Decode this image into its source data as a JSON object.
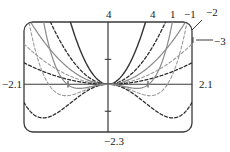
{
  "figure": {
    "name": "graphing-calculator-plot",
    "background": "#ffffff",
    "ink": "#3a3a3a",
    "frame": {
      "x": 24,
      "y": 22,
      "width": 168,
      "height": 110,
      "corner_radius": 9
    }
  },
  "axes": {
    "x_min": -2.1,
    "x_max": 2.1,
    "y_min": -2.3,
    "y_max": 3.0,
    "x_axis_y_value": 0,
    "y_axis_x_value": 0,
    "x_ticks": [
      -1,
      1
    ],
    "y_ticks": [
      -1.3,
      1.2
    ]
  },
  "labels": {
    "left": "−2.1",
    "right": "2.1",
    "bottom": "−2.3",
    "top_1": "4",
    "top_2": "4",
    "top_3": "1",
    "top_4": "−1",
    "top_5": "−2",
    "right_pointer": "−3"
  },
  "label_positions": {
    "left": {
      "x": 2,
      "y": 79
    },
    "right": {
      "x": 199,
      "y": 79
    },
    "bottom": {
      "x": 104,
      "y": 136
    },
    "top_1": {
      "x": 106,
      "y": 9
    },
    "top_2": {
      "x": 150,
      "y": 9
    },
    "top_3": {
      "x": 170,
      "y": 9
    },
    "top_4": {
      "x": 184,
      "y": 9
    },
    "top_5": {
      "x": 206,
      "y": 7
    },
    "right_pointer": {
      "x": 214,
      "y": 36
    }
  },
  "chart_data": {
    "type": "line",
    "title": "",
    "xlabel": "",
    "ylabel": "",
    "xlim": [
      -2.1,
      2.1
    ],
    "ylim": [
      -2.3,
      3.0
    ],
    "grid": false,
    "legend": false,
    "annotations": [
      {
        "text": "4",
        "anchor": "top",
        "note": "exponent label at top crossing"
      },
      {
        "text": "4",
        "anchor": "top",
        "note": "exponent label at top crossing"
      },
      {
        "text": "1",
        "anchor": "top",
        "note": "exponent label at top crossing"
      },
      {
        "text": "−1",
        "anchor": "top",
        "note": "exponent label at top crossing"
      },
      {
        "text": "−2",
        "anchor": "top-right",
        "note": "leader line to curve"
      },
      {
        "text": "−3",
        "anchor": "right",
        "note": "leader line to curve"
      },
      {
        "text": "−2.1",
        "anchor": "left",
        "note": "x window minimum"
      },
      {
        "text": "2.1",
        "anchor": "right",
        "note": "x window maximum"
      },
      {
        "text": "−2.3",
        "anchor": "bottom",
        "note": "y window minimum"
      }
    ],
    "series": [
      {
        "name": "solid-narrow-even",
        "style": "solid",
        "shade": "#333333",
        "width": 1.4,
        "kind": "even-power",
        "exponent": 2.0,
        "scale": 3.4
      },
      {
        "name": "dashed-even-wide",
        "style": "dashed",
        "shade": "#2e2e2e",
        "width": 1.3,
        "kind": "even-power",
        "exponent": 2.0,
        "scale": 1.45
      },
      {
        "name": "solid-gray-even",
        "style": "solid",
        "shade": "#8a8a8a",
        "width": 1.2,
        "kind": "even-power",
        "exponent": 2.0,
        "scale": 0.8
      },
      {
        "name": "dashed-gray-even",
        "style": "dashed",
        "shade": "#9a9a9a",
        "width": 1.1,
        "kind": "even-power",
        "exponent": 2.0,
        "scale": 0.44
      },
      {
        "name": "dashed-wide-outer",
        "style": "dashed",
        "shade": "#2e2e2e",
        "width": 1.3,
        "kind": "even-power",
        "exponent": 2.0,
        "scale": 0.235
      },
      {
        "name": "dashed-dip-inner",
        "style": "dashed",
        "shade": "#9a9a9a",
        "width": 1.1,
        "kind": "dip",
        "depth": 0.55,
        "reach": 1.05
      },
      {
        "name": "dashed-dip-outer",
        "style": "dashed",
        "shade": "#2e2e2e",
        "width": 1.3,
        "kind": "dip",
        "depth": 1.62,
        "reach": 1.62
      },
      {
        "name": "solid-dip-gray",
        "style": "solid",
        "shade": "#8a8a8a",
        "width": 1.2,
        "kind": "dip",
        "depth": 0.2,
        "reach": 0.72
      }
    ]
  }
}
